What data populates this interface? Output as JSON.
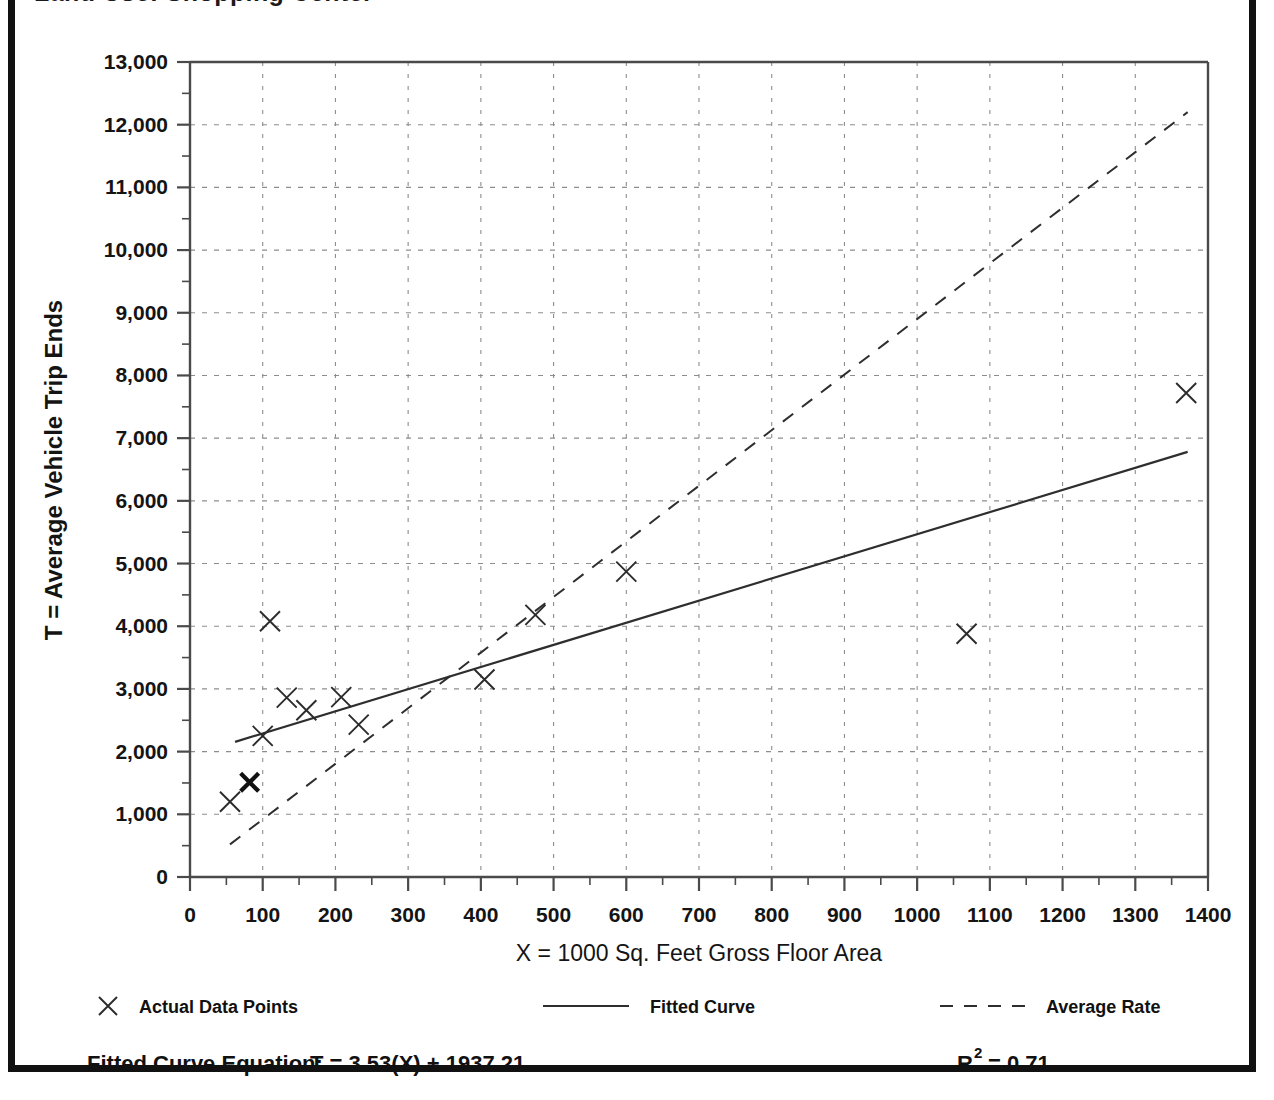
{
  "figure": {
    "title_partial": "Land Use: Shopping Center",
    "border_color": "#111111",
    "background": "#ffffff"
  },
  "chart_data": {
    "type": "scatter",
    "title": "",
    "xlabel": "X = 1000 Sq. Feet Gross Floor Area",
    "ylabel": "T = Average Vehicle Trip Ends",
    "xlim": [
      0,
      1400
    ],
    "ylim": [
      0,
      13000
    ],
    "x_major_step": 100,
    "x_minor_step": 50,
    "y_major_step": 1000,
    "y_minor_step": 500,
    "grid": true,
    "grid_style": "dotted",
    "legend_position": "below-axis",
    "x_ticks": [
      0,
      100,
      200,
      300,
      400,
      500,
      600,
      700,
      800,
      900,
      1000,
      1100,
      1200,
      1300,
      1400
    ],
    "x_tick_labels": [
      "0",
      "100",
      "200",
      "300",
      "400",
      "500",
      "600",
      "700",
      "800",
      "900",
      "1000",
      "1100",
      "1200",
      "1300",
      "1400"
    ],
    "y_ticks": [
      0,
      1000,
      2000,
      3000,
      4000,
      5000,
      6000,
      7000,
      8000,
      9000,
      10000,
      11000,
      12000,
      13000
    ],
    "y_tick_labels": [
      "0",
      "1,000",
      "2,000",
      "3,000",
      "4,000",
      "5,000",
      "6,000",
      "7,000",
      "8,000",
      "9,000",
      "10,000",
      "11,000",
      "12,000",
      "13,000"
    ],
    "series": [
      {
        "name": "Actual Data Points",
        "type": "scatter",
        "marker": "x",
        "points": [
          {
            "x": 55,
            "y": 1200,
            "bold": false
          },
          {
            "x": 82,
            "y": 1510,
            "bold": true
          },
          {
            "x": 100,
            "y": 2250,
            "bold": false
          },
          {
            "x": 110,
            "y": 4080,
            "bold": false
          },
          {
            "x": 133,
            "y": 2860,
            "bold": false
          },
          {
            "x": 160,
            "y": 2660,
            "bold": false
          },
          {
            "x": 208,
            "y": 2870,
            "bold": false
          },
          {
            "x": 232,
            "y": 2430,
            "bold": false
          },
          {
            "x": 405,
            "y": 3150,
            "bold": false
          },
          {
            "x": 475,
            "y": 4180,
            "bold": false
          },
          {
            "x": 600,
            "y": 4870,
            "bold": false
          },
          {
            "x": 1068,
            "y": 3880,
            "bold": false
          },
          {
            "x": 1370,
            "y": 7720,
            "bold": false
          }
        ]
      },
      {
        "name": "Fitted Curve",
        "type": "line",
        "style": "solid",
        "equation": "T = 3.53(X) + 1937.21",
        "slope": 3.53,
        "intercept": 1937.21,
        "x_start": 62,
        "x_end": 1372
      },
      {
        "name": "Average Rate",
        "type": "line",
        "style": "dashed",
        "x_start": 55,
        "y_start": 520,
        "x_end": 1372,
        "y_end": 12200
      }
    ]
  },
  "legend": {
    "items": [
      {
        "label": "Actual Data Points",
        "marker": "x"
      },
      {
        "label": "Fitted Curve",
        "marker": "solid-line"
      },
      {
        "label": "Average Rate",
        "marker": "dashed-line"
      }
    ]
  },
  "footer": {
    "equation_label": "Fitted Curve Equation:",
    "equation_value": "T = 3.53(X) + 1937.21",
    "r_squared_base": "R",
    "r_squared_exp": "2",
    "r_squared_value": "= 0.71"
  }
}
